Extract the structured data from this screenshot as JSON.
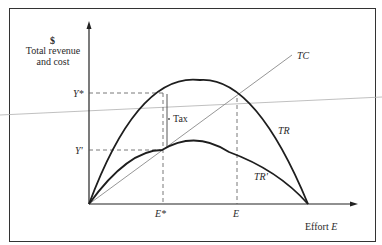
{
  "diagram": {
    "y_axis": {
      "symbol": "$",
      "label_line1": "Total revenue",
      "label_line2": "and cost"
    },
    "x_axis": {
      "label_text": "Effort",
      "label_var": "E"
    },
    "curves": {
      "tc": "TC",
      "tr": "TR",
      "tr_prime": "TR'"
    },
    "y_ticks": {
      "y_star": "Y*",
      "y_prime": "Y'"
    },
    "x_ticks": {
      "e_star": "E*",
      "e": "E"
    },
    "annotation": {
      "tax": "Tax"
    },
    "colors": {
      "curve": "#1e1e1e",
      "tc_line": "#8a8a8a",
      "guide": "#555555",
      "frame": "#333333"
    }
  }
}
